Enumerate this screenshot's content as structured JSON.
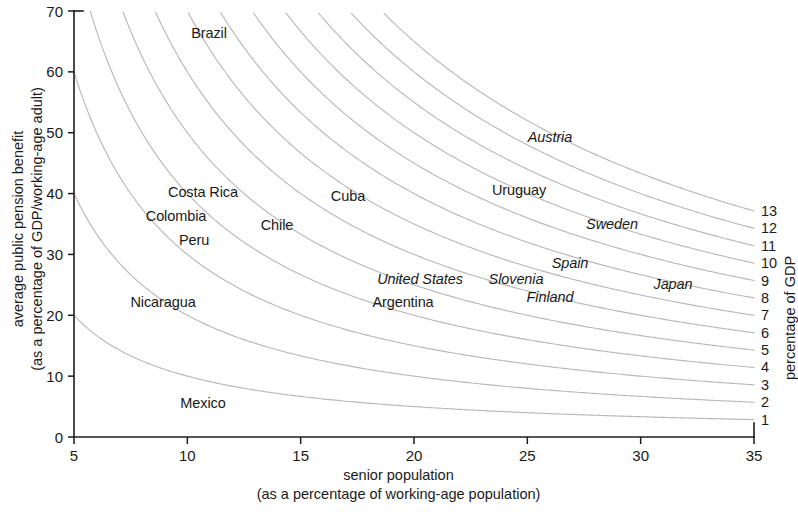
{
  "chart_data": {
    "type": "line",
    "title": "",
    "xlabel": "senior population (as a percentage of working-age population)",
    "xlabel_line1": "senior population",
    "xlabel_line2": "(as a percentage of working-age population)",
    "ylabel_line1": "average public pension benefit",
    "ylabel_line2": "(as a percentage of GDP/working-age adult)",
    "right_axis_label": "percentage of GDP",
    "xlim": [
      5,
      35
    ],
    "ylim": [
      0,
      70
    ],
    "xticks": [
      5,
      10,
      15,
      20,
      25,
      30,
      35
    ],
    "xtick_labels": [
      "5",
      "10",
      "15",
      "20",
      "25",
      "30",
      "35"
    ],
    "yticks": [
      0,
      10,
      20,
      30,
      40,
      50,
      60,
      70
    ],
    "ytick_labels": [
      "0",
      "10",
      "20",
      "30",
      "40",
      "50",
      "60",
      "70"
    ],
    "grid": false,
    "legend_position": "right-axis",
    "curve_formula": "y = 100 * c / x",
    "curve_levels": [
      1,
      2,
      3,
      4,
      5,
      6,
      7,
      8,
      9,
      10,
      11,
      12,
      13
    ],
    "curve_level_labels": [
      "1",
      "2",
      "3",
      "4",
      "5",
      "6",
      "7",
      "8",
      "9",
      "10",
      "11",
      "12",
      "13"
    ],
    "curve_color": "#b9b9b9",
    "axis_color": "#1c1c1c",
    "points": [
      {
        "name": "Brazil",
        "x": 11.2,
        "y": 63.0,
        "style": "roman",
        "px": 209,
        "py": 33
      },
      {
        "name": "Costa Rica",
        "x": 9.9,
        "y": 39.8,
        "style": "roman",
        "px": 203,
        "py": 192
      },
      {
        "name": "Colombia",
        "x": 9.3,
        "y": 36.7,
        "style": "roman",
        "px": 176,
        "py": 216
      },
      {
        "name": "Peru",
        "x": 10.3,
        "y": 33.8,
        "style": "roman",
        "px": 194,
        "py": 240
      },
      {
        "name": "Chile",
        "x": 13.8,
        "y": 34.3,
        "style": "roman",
        "px": 277,
        "py": 225
      },
      {
        "name": "Cuba",
        "x": 16.6,
        "y": 38.3,
        "style": "roman",
        "px": 348,
        "py": 196
      },
      {
        "name": "Nicaragua",
        "x": 8.4,
        "y": 23.4,
        "style": "roman",
        "px": 163,
        "py": 302
      },
      {
        "name": "Mexico",
        "x": 10.4,
        "y": 5.8,
        "style": "roman",
        "px": 203,
        "py": 403
      },
      {
        "name": "Austria",
        "x": 25.8,
        "y": 48.6,
        "style": "italic",
        "px": 550,
        "py": 137
      },
      {
        "name": "Uruguay",
        "x": 24.1,
        "y": 39.5,
        "style": "roman",
        "px": 519,
        "py": 190
      },
      {
        "name": "Sweden",
        "x": 29.0,
        "y": 34.8,
        "style": "italic",
        "px": 612,
        "py": 224
      },
      {
        "name": "Spain",
        "x": 27.4,
        "y": 29.6,
        "style": "italic",
        "px": 570,
        "py": 263
      },
      {
        "name": "Slovenia",
        "x": 24.7,
        "y": 26.5,
        "style": "italic",
        "px": 516,
        "py": 279
      },
      {
        "name": "United States",
        "x": 22.1,
        "y": 26.5,
        "style": "italic",
        "px": 420,
        "py": 279
      },
      {
        "name": "Finland",
        "x": 27.2,
        "y": 24.5,
        "style": "italic",
        "px": 550,
        "py": 297
      },
      {
        "name": "Japan",
        "x": 31.9,
        "y": 26.3,
        "style": "italic",
        "px": 673,
        "py": 284
      },
      {
        "name": "Argentina",
        "x": 21.1,
        "y": 24.2,
        "style": "roman",
        "px": 403,
        "py": 302
      }
    ]
  },
  "geometry": {
    "plot_left_px": 74,
    "plot_right_px": 754,
    "plot_top_px": 11,
    "plot_bottom_px": 437
  }
}
